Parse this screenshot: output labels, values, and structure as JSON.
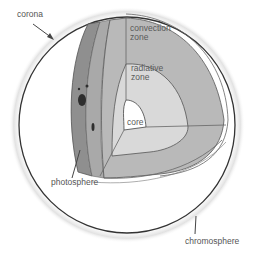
{
  "diagram": {
    "labels": {
      "corona": "corona",
      "convection_zone_line1": "convection",
      "convection_zone_line2": "zone",
      "radiative_zone_line1": "radiative",
      "radiative_zone_line2": "zone",
      "core": "core",
      "photosphere": "photosphere",
      "chromosphere": "chromosphere"
    },
    "colors": {
      "background": "#ffffff",
      "outline": "#333333",
      "photosphere_band": "#8f8f8f",
      "convection_zone": "#b9b9b9",
      "radiative_zone": "#d9d9d9",
      "core": "#ffffff",
      "sunspot": "#2e2e2e",
      "label_text": "#555555"
    }
  }
}
